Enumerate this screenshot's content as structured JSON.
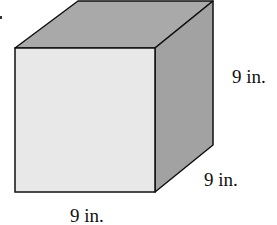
{
  "figure": {
    "shape": "cube",
    "colors": {
      "front_face": "#e8e8e8",
      "top_face": "#a9a9a9",
      "right_face": "#a2a2a2",
      "edge": "#111111",
      "background": "#ffffff"
    },
    "labels": {
      "height": "9 in.",
      "depth": "9 in.",
      "width": "9 in."
    }
  }
}
